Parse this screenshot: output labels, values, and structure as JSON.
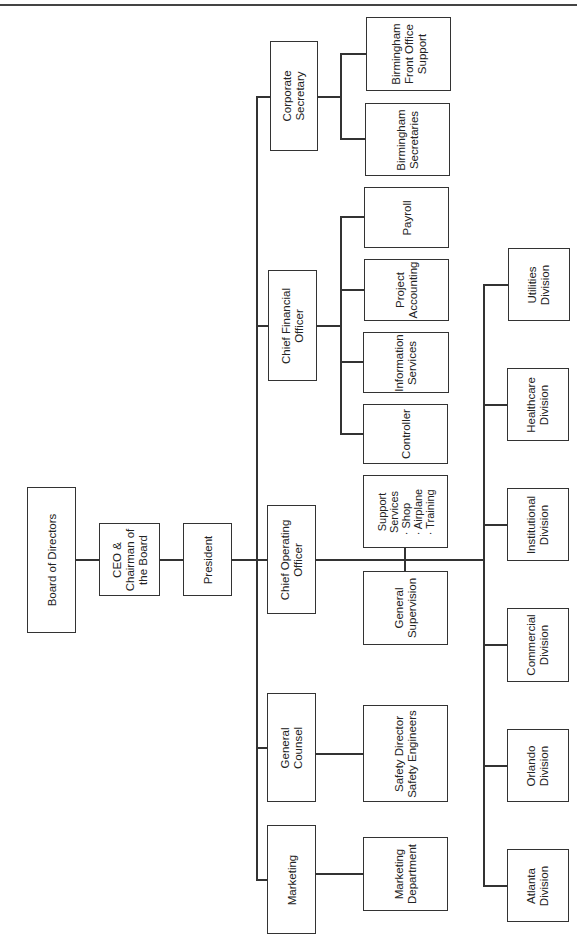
{
  "chart_title": "Organizational Chart",
  "nodes": {
    "board": {
      "lines": [
        "Board of Directors"
      ]
    },
    "ceo": {
      "lines": [
        "CEO &",
        "Chairman of",
        "the Board"
      ]
    },
    "president": {
      "lines": [
        "President"
      ]
    },
    "corporate_secretary": {
      "lines": [
        "Corporate",
        "Secretary"
      ]
    },
    "bham_front_office": {
      "lines": [
        "Birmingham",
        "Front Office",
        "Support"
      ]
    },
    "bham_secretaries": {
      "lines": [
        "Birmingham",
        "Secretaries"
      ]
    },
    "cfo": {
      "lines": [
        "Chief Financial",
        "Officer"
      ]
    },
    "payroll": {
      "lines": [
        "Payroll"
      ]
    },
    "project_accounting": {
      "lines": [
        "Project",
        "Accounting"
      ]
    },
    "information_services": {
      "lines": [
        "Information",
        "Services"
      ]
    },
    "controller": {
      "lines": [
        "Controller"
      ]
    },
    "coo": {
      "lines": [
        "Chief Operating",
        "Officer"
      ]
    },
    "support_services": {
      "lines": [
        "Support",
        "Services",
        "· Shop",
        "· Airplane",
        "· Training"
      ]
    },
    "general_supervision": {
      "lines": [
        "General",
        "Supervision"
      ]
    },
    "general_counsel": {
      "lines": [
        "General",
        "Counsel"
      ]
    },
    "safety": {
      "lines": [
        "Safety Director",
        "Safety Engineers"
      ]
    },
    "marketing": {
      "lines": [
        "Marketing"
      ]
    },
    "marketing_dept": {
      "lines": [
        "Marketing",
        "Department"
      ]
    },
    "utilities": {
      "lines": [
        "Utilities",
        "Division"
      ]
    },
    "healthcare": {
      "lines": [
        "Healthcare",
        "Division"
      ]
    },
    "institutional": {
      "lines": [
        "Institutional",
        "Division"
      ]
    },
    "commercial": {
      "lines": [
        "Commercial",
        "Division"
      ]
    },
    "orlando": {
      "lines": [
        "Orlando",
        "Division"
      ]
    },
    "atlanta": {
      "lines": [
        "Atlanta",
        "Division"
      ]
    }
  },
  "colors": {
    "line": "#333333",
    "background": "#ffffff"
  }
}
